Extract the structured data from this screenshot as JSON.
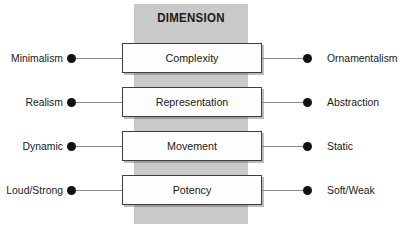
{
  "figure": {
    "type": "bipolar-dimension-diagram",
    "band_title": "DIMENSION",
    "background_color": "#ffffff",
    "band_color": "#c9c9c9",
    "box_fill_color": "#fdfdfd",
    "box_border_color": "#3d3d3d",
    "connector_color": "#8a8a8a",
    "dot_color": "#111111",
    "text_color": "#1a1a1a"
  },
  "rows": [
    {
      "left_pole": "Minimalism",
      "dimension": "Complexity",
      "right_pole": "Ornamentalism"
    },
    {
      "left_pole": "Realism",
      "dimension": "Representation",
      "right_pole": "Abstraction"
    },
    {
      "left_pole": "Dynamic",
      "dimension": "Movement",
      "right_pole": "Static"
    },
    {
      "left_pole": "Loud/Strong",
      "dimension": "Potency",
      "right_pole": "Soft/Weak"
    }
  ]
}
